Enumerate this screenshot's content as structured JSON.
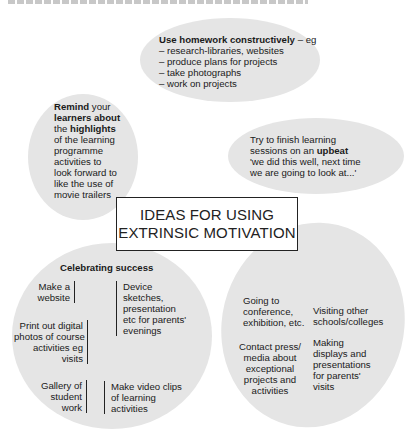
{
  "colors": {
    "bubble_fill": "#e5e5e5",
    "text": "#1a1a1a",
    "box_border": "#222222"
  },
  "center": {
    "line1": "IDEAS FOR USING",
    "line2": "EXTRINSIC MOTIVATION"
  },
  "homework": {
    "heading_bold": "Use homework constructively",
    "heading_rest": " – eg",
    "items": [
      "– research-libraries, websites",
      "– produce plans for projects",
      "– take photographs",
      "– work on projects"
    ]
  },
  "remind": {
    "w1": "Remind",
    "w2": " your",
    "w3": "learners about",
    "w4": "the ",
    "w5": "highlights",
    "lines": [
      "of the learning",
      "programme",
      "activities to",
      "look forward to",
      "like the use of",
      "movie trailers"
    ]
  },
  "upbeat": {
    "line1": "Try to finish learning",
    "line2a": "sessions on an ",
    "line2b": "upbeat",
    "line3": "'we did this well, next time",
    "line4": "we are going to look at...'"
  },
  "celebrating": {
    "title": "Celebrating success",
    "website": [
      "Make a",
      "website"
    ],
    "device": [
      "Device",
      "sketches,",
      "presentation",
      "etc for parents'",
      "evenings"
    ],
    "print": [
      "Print out digital",
      "photos of course",
      "activities eg",
      "visits"
    ],
    "gallery": [
      "Gallery of",
      "student",
      "work"
    ],
    "video": [
      "Make video clips",
      "of learning",
      "activities"
    ]
  },
  "outreach": {
    "conference": [
      "Going to",
      "conference,",
      "exhibition, etc."
    ],
    "visiting": [
      "Visiting other",
      "schools/colleges"
    ],
    "press": [
      "Contact press/",
      "media about",
      "exceptional",
      "projects and",
      "activities"
    ],
    "displays": [
      "Making",
      "displays and",
      "presentations",
      "for parents'",
      "visits"
    ]
  }
}
